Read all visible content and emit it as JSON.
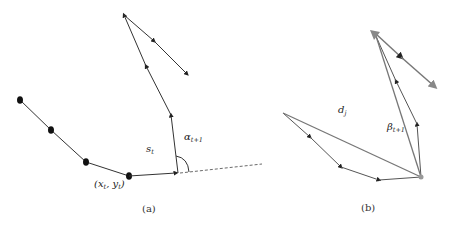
{
  "figure": {
    "panels": [
      {
        "id": "a",
        "caption": "(a)",
        "labels": {
          "segment": "s",
          "segment_sub": "t",
          "angle": "α",
          "angle_sub": "t+1",
          "point": "(x",
          "point_x_sub": "t",
          "point_sep": ", y",
          "point_y_sub": "t",
          "point_close": ")"
        },
        "stroke_color": "#333333"
      },
      {
        "id": "b",
        "caption": "(b)",
        "labels": {
          "distance": "d",
          "distance_sub": "j",
          "angle": "β",
          "angle_sub": "t+1"
        },
        "stroke_color": "#555555",
        "accent_color": "#888888"
      }
    ]
  }
}
